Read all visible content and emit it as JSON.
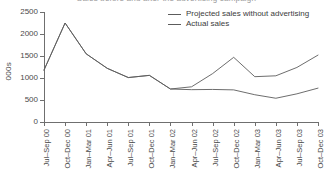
{
  "title_clipped": "Sales before and after the advertising campaign",
  "axes": {
    "ylabel": "000s",
    "yticks": [
      "0",
      "500",
      "1000",
      "1500",
      "2000",
      "2500"
    ],
    "ylim_min": 0,
    "ylim_max": 2500,
    "grid": false
  },
  "legend": {
    "position": "top-right",
    "items": [
      {
        "label": "Projected sales without advertising",
        "color": "#5c5c5c"
      },
      {
        "label": "Actual sales",
        "color": "#5c5c5c"
      }
    ]
  },
  "chart_data": {
    "type": "line",
    "title": "",
    "xlabel": "",
    "ylabel": "000s",
    "ylim": [
      0,
      2500
    ],
    "grid": false,
    "legend_position": "top-right",
    "categories": [
      "Jul–Sep 00",
      "Oct–Dec 00",
      "Jan–Mar 01",
      "Apr–Jun 01",
      "Jul–Sep 01",
      "Oct–Dec 01",
      "Jan–Mar 02",
      "Apr–Jun 02",
      "Jul–Sep 02",
      "Oct–Dec 02",
      "Jan–Mar 03",
      "Apr–Jun 03",
      "Jul–Sep 03",
      "Oct–Dec 03"
    ],
    "series": [
      {
        "name": "Projected sales without advertising",
        "color": "#5c5c5c",
        "values": [
          1180,
          2250,
          1550,
          1220,
          1010,
          1060,
          750,
          800,
          1100,
          1470,
          1030,
          1050,
          1240,
          1520
        ]
      },
      {
        "name": "Actual sales",
        "color": "#5c5c5c",
        "values": [
          1180,
          2250,
          1550,
          1220,
          1010,
          1060,
          750,
          735,
          740,
          730,
          620,
          540,
          640,
          770
        ]
      }
    ]
  }
}
